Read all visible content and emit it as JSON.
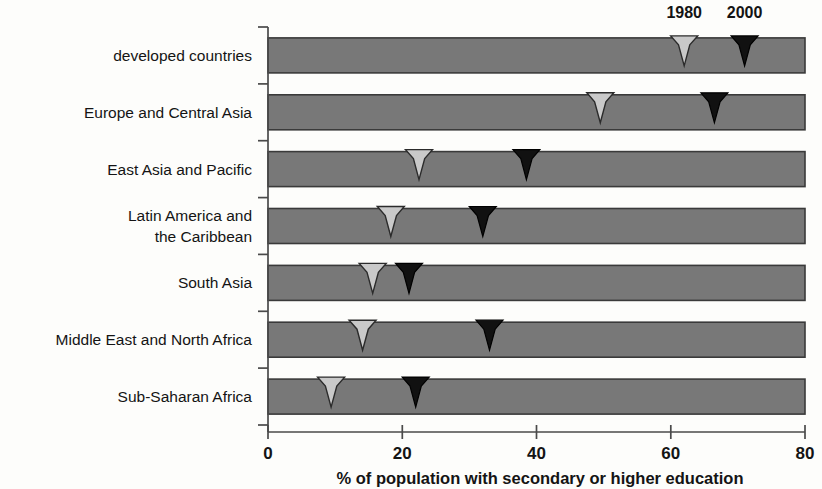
{
  "chart_data": {
    "type": "bar",
    "title": "",
    "subtitle": "",
    "xlabel": "% of population with secondary or higher education",
    "ylabel": "",
    "xlim": [
      0,
      80
    ],
    "xticks": [
      0,
      20,
      40,
      60,
      80
    ],
    "xtick_labels": [
      "0",
      "20",
      "40",
      "60",
      "80"
    ],
    "grid": false,
    "legend_position": "top-right",
    "orientation": "horizontal",
    "note": "Each row is a full-width gray bar spanning 0-80; two arrow markers per row indicate the value for 1980 (light gray arrow) and 2000 (black arrow).",
    "categories": [
      "developed countries",
      "Europe and Central Asia",
      "East Asia and Pacific",
      "Latin America and\nthe Caribbean",
      "South Asia",
      "Middle East and North Africa",
      "Sub-Saharan Africa"
    ],
    "category_lines": [
      [
        "developed countries"
      ],
      [
        "Europe and Central Asia"
      ],
      [
        "East Asia and Pacific"
      ],
      [
        "Latin America and",
        "the Caribbean"
      ],
      [
        "South Asia"
      ],
      [
        "Middle East and North Africa"
      ],
      [
        "Sub-Saharan Africa"
      ]
    ],
    "bar_extent": 80,
    "series": [
      {
        "name": "1980",
        "color": "#c9c9c9",
        "values": [
          62,
          49.5,
          22.5,
          18.3,
          15.6,
          14.1,
          9.4
        ]
      },
      {
        "name": "2000",
        "color": "#111111",
        "values": [
          71,
          66.5,
          38.5,
          32,
          21,
          33,
          22
        ]
      }
    ]
  },
  "legend": {
    "items": [
      {
        "label": "1980",
        "marker": "arrow-down-light"
      },
      {
        "label": "2000",
        "marker": "arrow-down-dark"
      }
    ]
  },
  "colors": {
    "bar_fill": "#787878",
    "bar_stroke": "#3a3a3a",
    "marker_1980": "#c9c9c9",
    "marker_2000": "#111111",
    "axis": "#4a4a4a",
    "text": "#141414",
    "background": "#fdfdfb"
  }
}
